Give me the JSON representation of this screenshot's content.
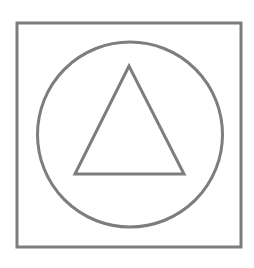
{
  "figure": {
    "width": 254,
    "height": 268,
    "background": "#ffffff",
    "stroke_color": "#7d7d7d",
    "shapes": {
      "square": {
        "x": 17,
        "y": 23,
        "width": 224,
        "height": 224,
        "stroke_width": 3
      },
      "circle": {
        "cx": 130,
        "cy": 134.5,
        "r": 92.5,
        "stroke_width": 3
      },
      "triangle": {
        "points": "129,66 75,174 184,174",
        "stroke_width": 3
      }
    }
  }
}
